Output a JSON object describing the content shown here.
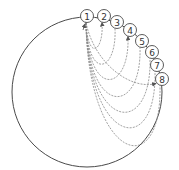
{
  "diagram": {
    "type": "circular-sequence",
    "outer_circle": {
      "cx": 87,
      "cy": 92,
      "r": 75,
      "stroke": "#4a4a4a"
    },
    "node_radius": 6.5,
    "node_stroke": "#4a4a4a",
    "curve_stroke": "#8a8a8a",
    "nodes": [
      {
        "id": "1",
        "label": "1",
        "cx": 87,
        "cy": 16
      },
      {
        "id": "2",
        "label": "2",
        "cx": 104,
        "cy": 16
      },
      {
        "id": "3",
        "label": "3",
        "cx": 117,
        "cy": 22
      },
      {
        "id": "4",
        "label": "4",
        "cx": 130,
        "cy": 30
      },
      {
        "id": "5",
        "label": "5",
        "cx": 142,
        "cy": 41
      },
      {
        "id": "6",
        "label": "6",
        "cx": 152,
        "cy": 52
      },
      {
        "id": "7",
        "label": "7",
        "cx": 157,
        "cy": 65
      },
      {
        "id": "8",
        "label": "8",
        "cx": 162,
        "cy": 79
      }
    ],
    "edges": [
      {
        "from": "1",
        "to": "2",
        "depth": 32,
        "arrow": "end"
      },
      {
        "from": "1",
        "to": "3",
        "depth": 48,
        "arrow": "none"
      },
      {
        "from": "1",
        "to": "4",
        "depth": 62,
        "arrow": "end"
      },
      {
        "from": "1",
        "to": "5",
        "depth": 76,
        "arrow": "none"
      },
      {
        "from": "1",
        "to": "6",
        "depth": 88,
        "arrow": "none"
      },
      {
        "from": "1",
        "to": "7",
        "depth": 98,
        "arrow": "none"
      },
      {
        "from": "1",
        "to": "8",
        "depth": 110,
        "arrow": "none"
      },
      {
        "from": "1",
        "to": "8",
        "depth": 40,
        "arrow": "end",
        "style": "direct"
      }
    ]
  }
}
